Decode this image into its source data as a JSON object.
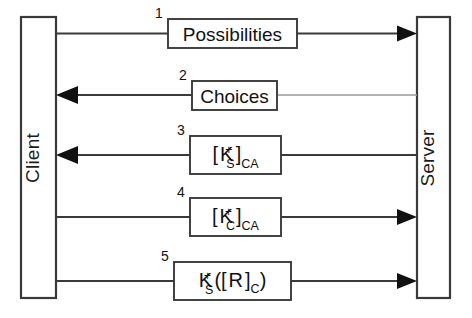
{
  "diagram": {
    "type": "sequence-diagram",
    "background_color": "#ffffff",
    "line_color": "#3a3a3a",
    "text_color": "#111111"
  },
  "actors": {
    "left": {
      "name": "Client",
      "label": "Client",
      "orientation": "vertical-bottom-to-top"
    },
    "right": {
      "name": "Server",
      "label": "Server",
      "orientation": "vertical-bottom-to-top"
    }
  },
  "messages": [
    {
      "number": "1",
      "label": "Possibilities",
      "plain_text": "Possibilities",
      "direction": "client-to-server",
      "arrow_at": "server",
      "has_subscripts": false
    },
    {
      "number": "2",
      "label": "Choices",
      "plain_text": "Choices",
      "direction": "server-to-client",
      "arrow_at": "client",
      "has_subscripts": false
    },
    {
      "number": "3",
      "label": "[ K+S ]CA",
      "plain_text": "[ K_S^+ ]_CA",
      "direction": "server-to-client",
      "arrow_at": "client",
      "has_subscripts": true,
      "parts": {
        "open_bracket": "[",
        "key": "K",
        "superscript": "+",
        "subscript": "S",
        "close_bracket": "]",
        "signer": "CA"
      }
    },
    {
      "number": "4",
      "label": "[ K+C ]CA",
      "plain_text": "[ K_C^+ ]_CA",
      "direction": "client-to-server",
      "arrow_at": "server",
      "has_subscripts": true,
      "parts": {
        "open_bracket": "[",
        "key": "K",
        "superscript": "+",
        "subscript": "C",
        "close_bracket": "]",
        "signer": "CA"
      }
    },
    {
      "number": "5",
      "label": "K+S([ R ]C)",
      "plain_text": "K_S^+([ R ]_C)",
      "direction": "client-to-server",
      "arrow_at": "server",
      "has_subscripts": true,
      "parts": {
        "key": "K",
        "superscript": "+",
        "subscript": "S",
        "open_paren": "([",
        "payload": "R",
        "close_bracket": "]",
        "payload_subscript": "C",
        "close_paren": ")"
      }
    }
  ]
}
